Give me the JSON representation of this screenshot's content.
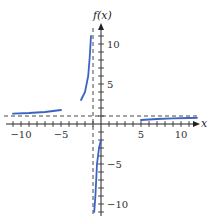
{
  "chart_data": {
    "type": "line",
    "title": "",
    "xlabel": "x",
    "ylabel": "f(x)",
    "xlim": [
      -11.5,
      12
    ],
    "ylim": [
      -11.5,
      12
    ],
    "x_ticks": [
      -10,
      -5,
      5,
      10
    ],
    "y_ticks": [
      10,
      5,
      -5,
      -10
    ],
    "x_tick_labels": [
      "−10",
      "−5",
      "5",
      "10"
    ],
    "y_tick_labels": [
      "10",
      "5",
      "−5",
      "−10"
    ],
    "grid": false,
    "asymptotes": {
      "horizontal": 1,
      "vertical": -1
    },
    "series": [
      {
        "name": "f(x) left branch (x < -5)",
        "x": [
          -11,
          -9,
          -7,
          -5
        ],
        "y": [
          1.3,
          1.375,
          1.5,
          1.75
        ]
      },
      {
        "name": "f(x) branch (-2.5 to -1.2)",
        "x": [
          -2.5,
          -2,
          -1.6,
          -1.4,
          -1.25
        ],
        "y": [
          3.0,
          4.0,
          6.0,
          8.5,
          11.0
        ]
      },
      {
        "name": "f(x) branch (-0.85 to 0)",
        "x": [
          -0.85,
          -0.7,
          -0.5,
          -0.25,
          0
        ],
        "y": [
          -11.0,
          -9.0,
          -5.0,
          -3.0,
          -2.0
        ]
      },
      {
        "name": "f(x) right branch (x > 5)",
        "x": [
          5,
          7,
          9,
          11,
          12
        ],
        "y": [
          0.5,
          0.625,
          0.7,
          0.75,
          0.77
        ]
      }
    ],
    "colors": {
      "curve": "#3a64c4",
      "axis": "#222222",
      "asymptote": "#333333"
    }
  }
}
